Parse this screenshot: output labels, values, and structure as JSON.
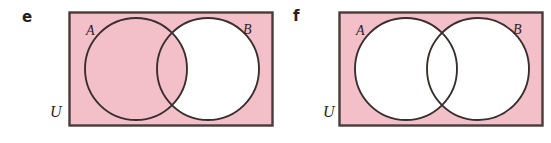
{
  "figure": {
    "caption_hidden": "",
    "colors": {
      "universe_fill": "#f3bfc9",
      "circle_fill_unshaded": "#ffffff",
      "stroke": "#3a2f2f",
      "rect_border": "#4a3b3b",
      "text": "#2b2422",
      "panel_letter": "#231f20",
      "background": "#ffffff"
    }
  },
  "panels": [
    {
      "id": "e",
      "letter": "e",
      "universe_label": "U",
      "set_a_label": "A",
      "set_b_label": "B",
      "shaded_description": "All of U except the part of B outside A",
      "regions": {
        "outside_both": "shaded",
        "a_only": "shaded",
        "intersection": "shaded",
        "b_only": "unshaded"
      }
    },
    {
      "id": "f",
      "letter": "f",
      "universe_label": "U",
      "set_a_label": "A",
      "set_b_label": "B",
      "shaded_description": "Only the region of U outside both A and B",
      "regions": {
        "outside_both": "shaded",
        "a_only": "unshaded",
        "intersection": "unshaded",
        "b_only": "unshaded"
      }
    }
  ]
}
